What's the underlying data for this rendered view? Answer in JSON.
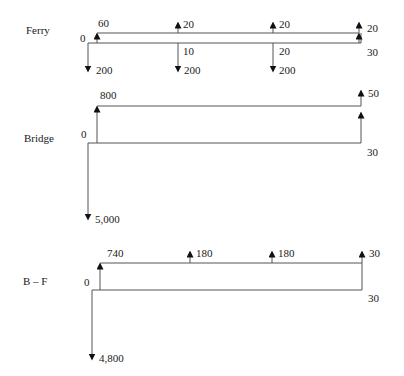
{
  "diagrams": {
    "ferry": {
      "name": "Ferry",
      "start_label": "0",
      "end_label": "30",
      "receipts": [
        "60",
        "20",
        "20",
        "20"
      ],
      "costs": [
        "200",
        "200",
        "200"
      ],
      "mid_labels": [
        "10",
        "20"
      ]
    },
    "bridge": {
      "name": "Bridge",
      "start_label": "0",
      "end_label": "30",
      "receipts": [
        "800",
        "50"
      ],
      "costs": [
        "5,000"
      ]
    },
    "bf": {
      "name": "B – F",
      "start_label": "0",
      "end_label": "30",
      "receipts": [
        "740",
        "180",
        "180",
        "30"
      ],
      "costs": [
        "4,800"
      ]
    }
  },
  "colors": {
    "line": "#555555",
    "arrow": "#111111",
    "text": "#1a1a1a"
  }
}
